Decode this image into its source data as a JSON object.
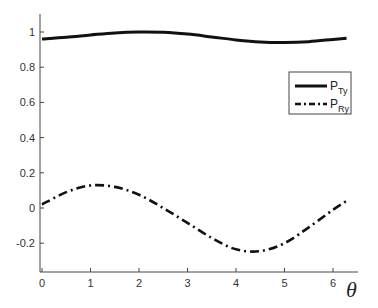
{
  "chart_data": {
    "type": "line",
    "title": "",
    "xlabel": "θ",
    "ylabel": "",
    "xlim": [
      0,
      6.6
    ],
    "ylim": [
      -0.35,
      1.1
    ],
    "xticks": [
      0,
      1,
      2,
      3,
      4,
      5,
      6
    ],
    "yticks": [
      -0.2,
      0,
      0.2,
      0.4,
      0.6,
      0.8,
      1
    ],
    "ytick_labels": [
      "-0.2",
      "0",
      "0.2",
      "0.4",
      "0.6",
      "0.8",
      "1"
    ],
    "xtick_labels": [
      "0",
      "1",
      "2",
      "3",
      "4",
      "5",
      "6"
    ],
    "grid": false,
    "legend_position": "upper right",
    "x": [
      0,
      0.5,
      1.0,
      1.5,
      2.0,
      2.5,
      3.0,
      3.5,
      4.0,
      4.5,
      5.0,
      5.5,
      6.0,
      6.28
    ],
    "series": [
      {
        "name": "P_Ty",
        "label_main": "P",
        "label_sub": "Ty",
        "style": "solid",
        "values": [
          0.96,
          0.97,
          0.983,
          0.995,
          1.0,
          0.998,
          0.988,
          0.972,
          0.955,
          0.943,
          0.94,
          0.945,
          0.958,
          0.965
        ]
      },
      {
        "name": "P_Ry",
        "label_main": "P",
        "label_sub": "Ry",
        "style": "dashdot",
        "values": [
          0.02,
          0.09,
          0.128,
          0.12,
          0.075,
          0.0,
          -0.085,
          -0.17,
          -0.235,
          -0.245,
          -0.2,
          -0.11,
          -0.01,
          0.04
        ]
      }
    ]
  }
}
